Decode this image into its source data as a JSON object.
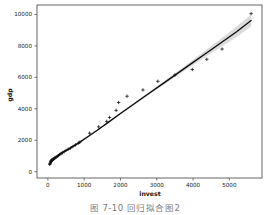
{
  "figure": {
    "caption": "图 7-10   回归拟合图2",
    "background_color": "#ffffff"
  },
  "chart_data": {
    "type": "scatter",
    "title": "",
    "xlabel": "invest",
    "ylabel": "gdp",
    "xlim": [
      -300,
      5900
    ],
    "ylim": [
      -400,
      10600
    ],
    "xticks": [
      0,
      1000,
      2000,
      3000,
      4000,
      5000
    ],
    "xticklabels": [
      "0",
      "1000",
      "2000",
      "3000",
      "4000",
      "5000"
    ],
    "yticks": [
      0,
      2000,
      4000,
      6000,
      8000,
      10000
    ],
    "yticklabels": [
      "0",
      "2000",
      "4000",
      "6000",
      "8000",
      "10000"
    ],
    "grid": false,
    "legend": null,
    "marker_style": "+",
    "marker_color": "#101010",
    "line_color": "#0d0d0d",
    "band_color": "#d9d9d9",
    "points": [
      {
        "x": 50,
        "y": 460
      },
      {
        "x": 60,
        "y": 520
      },
      {
        "x": 70,
        "y": 600
      },
      {
        "x": 80,
        "y": 650
      },
      {
        "x": 90,
        "y": 700
      },
      {
        "x": 100,
        "y": 730
      },
      {
        "x": 120,
        "y": 760
      },
      {
        "x": 140,
        "y": 790
      },
      {
        "x": 160,
        "y": 820
      },
      {
        "x": 180,
        "y": 850
      },
      {
        "x": 200,
        "y": 890
      },
      {
        "x": 230,
        "y": 930
      },
      {
        "x": 260,
        "y": 980
      },
      {
        "x": 290,
        "y": 1030
      },
      {
        "x": 320,
        "y": 1090
      },
      {
        "x": 360,
        "y": 1150
      },
      {
        "x": 400,
        "y": 1210
      },
      {
        "x": 450,
        "y": 1280
      },
      {
        "x": 500,
        "y": 1350
      },
      {
        "x": 560,
        "y": 1430
      },
      {
        "x": 620,
        "y": 1500
      },
      {
        "x": 690,
        "y": 1600
      },
      {
        "x": 760,
        "y": 1700
      },
      {
        "x": 840,
        "y": 1810
      },
      {
        "x": 880,
        "y": 1880
      },
      {
        "x": 1150,
        "y": 2450
      },
      {
        "x": 1400,
        "y": 2850
      },
      {
        "x": 1620,
        "y": 3200
      },
      {
        "x": 1700,
        "y": 3450
      },
      {
        "x": 1880,
        "y": 3900
      },
      {
        "x": 1950,
        "y": 4400
      },
      {
        "x": 2180,
        "y": 4800
      },
      {
        "x": 2620,
        "y": 5200
      },
      {
        "x": 3030,
        "y": 5750
      },
      {
        "x": 3500,
        "y": 6150
      },
      {
        "x": 3980,
        "y": 6500
      },
      {
        "x": 4380,
        "y": 7150
      },
      {
        "x": 4800,
        "y": 7800
      },
      {
        "x": 5600,
        "y": 10050
      }
    ],
    "fit_curve": [
      {
        "x": 50,
        "y": 500
      },
      {
        "x": 200,
        "y": 880
      },
      {
        "x": 400,
        "y": 1210
      },
      {
        "x": 600,
        "y": 1480
      },
      {
        "x": 880,
        "y": 1880
      },
      {
        "x": 1150,
        "y": 2300
      },
      {
        "x": 1400,
        "y": 2700
      },
      {
        "x": 1700,
        "y": 3200
      },
      {
        "x": 2000,
        "y": 3700
      },
      {
        "x": 2400,
        "y": 4350
      },
      {
        "x": 2800,
        "y": 5000
      },
      {
        "x": 3200,
        "y": 5650
      },
      {
        "x": 3600,
        "y": 6300
      },
      {
        "x": 4000,
        "y": 6950
      },
      {
        "x": 4400,
        "y": 7600
      },
      {
        "x": 4800,
        "y": 8250
      },
      {
        "x": 5200,
        "y": 8900
      },
      {
        "x": 5600,
        "y": 9620
      }
    ],
    "band_upper": [
      {
        "x": 50,
        "y": 620
      },
      {
        "x": 200,
        "y": 980
      },
      {
        "x": 400,
        "y": 1290
      },
      {
        "x": 600,
        "y": 1550
      },
      {
        "x": 880,
        "y": 1940
      },
      {
        "x": 1150,
        "y": 2350
      },
      {
        "x": 1400,
        "y": 2750
      },
      {
        "x": 1700,
        "y": 3250
      },
      {
        "x": 2000,
        "y": 3760
      },
      {
        "x": 2400,
        "y": 4420
      },
      {
        "x": 2800,
        "y": 5090
      },
      {
        "x": 3200,
        "y": 5760
      },
      {
        "x": 3600,
        "y": 6440
      },
      {
        "x": 4000,
        "y": 7120
      },
      {
        "x": 4400,
        "y": 7820
      },
      {
        "x": 4800,
        "y": 8520
      },
      {
        "x": 5200,
        "y": 9240
      },
      {
        "x": 5600,
        "y": 10000
      }
    ],
    "band_lower": [
      {
        "x": 50,
        "y": 380
      },
      {
        "x": 200,
        "y": 780
      },
      {
        "x": 400,
        "y": 1130
      },
      {
        "x": 600,
        "y": 1410
      },
      {
        "x": 880,
        "y": 1820
      },
      {
        "x": 1150,
        "y": 2250
      },
      {
        "x": 1400,
        "y": 2650
      },
      {
        "x": 1700,
        "y": 3150
      },
      {
        "x": 2000,
        "y": 3640
      },
      {
        "x": 2400,
        "y": 4280
      },
      {
        "x": 2800,
        "y": 4910
      },
      {
        "x": 3200,
        "y": 5540
      },
      {
        "x": 3600,
        "y": 6160
      },
      {
        "x": 4000,
        "y": 6780
      },
      {
        "x": 4400,
        "y": 7380
      },
      {
        "x": 4800,
        "y": 7980
      },
      {
        "x": 5200,
        "y": 8560
      },
      {
        "x": 5600,
        "y": 9240
      }
    ]
  }
}
